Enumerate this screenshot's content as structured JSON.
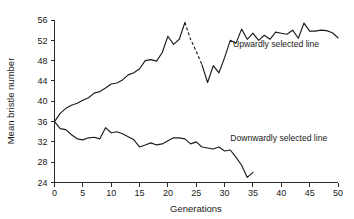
{
  "chart_data": {
    "type": "line",
    "title": "",
    "xlabel": "Generations",
    "ylabel": "Mean bristle number",
    "xlim": [
      0,
      50
    ],
    "ylim": [
      24,
      56
    ],
    "xticks": [
      0,
      5,
      10,
      15,
      20,
      25,
      30,
      35,
      40,
      45,
      50
    ],
    "yticks": [
      24,
      28,
      32,
      36,
      40,
      44,
      48,
      52,
      56
    ],
    "grid": false,
    "legend_position": "inline-annotations",
    "line_color": "#1c1c1c",
    "series": [
      {
        "name": "Upwardly selected line",
        "annotation": "Upwardly selected line",
        "annotation_x": 31.5,
        "annotation_y": 50.6,
        "x": [
          0,
          1,
          2,
          3,
          4,
          5,
          6,
          7,
          8,
          9,
          10,
          11,
          12,
          13,
          14,
          15,
          16,
          17,
          18,
          19,
          20,
          21,
          22,
          23,
          24,
          25,
          26,
          27,
          28,
          29,
          30,
          31,
          32,
          33,
          34,
          35,
          36,
          37,
          38,
          39,
          40,
          41,
          42,
          43,
          44,
          45,
          46,
          47,
          48,
          49,
          50
        ],
        "values": [
          36.0,
          37.6,
          38.6,
          39.2,
          39.6,
          40.2,
          40.7,
          41.6,
          41.9,
          42.6,
          43.4,
          43.6,
          44.2,
          45.2,
          45.6,
          46.4,
          48.0,
          48.2,
          47.9,
          49.6,
          52.8,
          51.2,
          52.2,
          55.5,
          52.2,
          49.8,
          47.2,
          43.7,
          47.0,
          45.6,
          48.6,
          52.0,
          51.4,
          54.2,
          52.2,
          53.4,
          52.0,
          53.0,
          52.2,
          53.6,
          53.4,
          53.2,
          54.0,
          52.4,
          55.4,
          53.8,
          53.8,
          54.0,
          53.9,
          53.5,
          52.5
        ],
        "note": "Values plotted against generation; a dashed segment spans the decline after the peak near generation 20."
      },
      {
        "name": "Downwardly selected line",
        "annotation": "Downwardly selected line",
        "annotation_x": 31.0,
        "annotation_y": 32.1,
        "x": [
          0,
          1,
          2,
          3,
          4,
          5,
          6,
          7,
          8,
          9,
          10,
          11,
          12,
          13,
          14,
          15,
          16,
          17,
          18,
          19,
          20,
          21,
          22,
          23,
          24,
          25,
          26,
          27,
          28,
          29,
          30,
          31,
          32,
          33,
          34,
          35
        ],
        "values": [
          36.0,
          34.6,
          34.4,
          33.4,
          32.6,
          32.4,
          32.8,
          32.9,
          32.6,
          34.8,
          33.8,
          34.0,
          33.6,
          33.0,
          32.4,
          31.0,
          31.4,
          31.8,
          31.4,
          31.6,
          32.2,
          32.8,
          32.8,
          32.6,
          31.6,
          32.0,
          31.0,
          30.8,
          30.6,
          31.0,
          30.2,
          30.4,
          29.0,
          27.4,
          25.0,
          26.0
        ]
      }
    ],
    "dashed_segment": {
      "series": "Upwardly selected line",
      "x": [
        23,
        24,
        25,
        26
      ],
      "values": [
        55.5,
        52.2,
        49.8,
        47.2
      ]
    }
  },
  "axes": {
    "x_title": "Generations",
    "y_title": "Mean bristle number"
  }
}
